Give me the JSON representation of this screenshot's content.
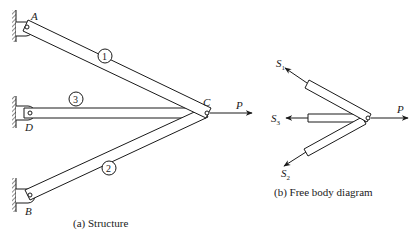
{
  "structure": {
    "caption": "(a) Structure",
    "supports": [
      {
        "id": "A",
        "label": "A"
      },
      {
        "id": "D",
        "label": "D"
      },
      {
        "id": "B",
        "label": "B"
      }
    ],
    "joint": {
      "id": "C",
      "label": "C"
    },
    "load": {
      "label": "P"
    },
    "members": [
      {
        "id": "1",
        "label": "1",
        "from": "A",
        "to": "C"
      },
      {
        "id": "2",
        "label": "2",
        "from": "B",
        "to": "C"
      },
      {
        "id": "3",
        "label": "3",
        "from": "D",
        "to": "C"
      }
    ]
  },
  "free_body": {
    "caption": "(b) Free body diagram",
    "forces": [
      {
        "symbol": "S",
        "sub": "1"
      },
      {
        "symbol": "S",
        "sub": "3"
      },
      {
        "symbol": "S",
        "sub": "2"
      }
    ],
    "load": {
      "label": "P"
    }
  },
  "colors": {
    "ink": "#1a1a1a",
    "background": "#ffffff"
  }
}
